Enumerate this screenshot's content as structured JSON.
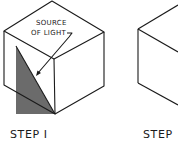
{
  "figure": {
    "panels": [
      {
        "id": "step-1",
        "caption": "STEP I",
        "callout": {
          "line1": "SOURCE",
          "line2": "OF LIGHT"
        },
        "shadow_color": "#6b6b6b"
      },
      {
        "id": "step-2",
        "caption": "STEP"
      }
    ]
  }
}
